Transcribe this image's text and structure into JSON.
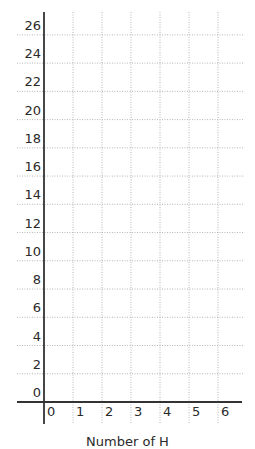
{
  "chart_data": {
    "type": "line",
    "title": "",
    "xlabel": "Number of H",
    "ylabel": "",
    "x_ticks": [
      "0",
      "1",
      "2",
      "3",
      "4",
      "5",
      "6"
    ],
    "y_ticks": [
      "0",
      "2",
      "4",
      "6",
      "8",
      "10",
      "12",
      "14",
      "16",
      "18",
      "20",
      "22",
      "24",
      "26"
    ],
    "xlim": [
      0,
      6.8
    ],
    "ylim": [
      0,
      27.5
    ],
    "grid": true,
    "grid_style": "dotted",
    "series": [],
    "note": "Blank coordinate grid with no plotted data"
  },
  "colors": {
    "axis": "#333333",
    "grid": "#b5b5b5",
    "text": "#2a2a2a",
    "background": "#ffffff"
  }
}
